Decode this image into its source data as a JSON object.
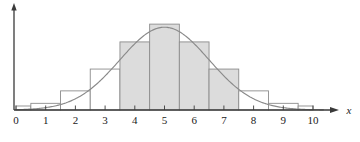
{
  "chart_data": {
    "type": "bar",
    "title": "",
    "subtitle": "",
    "xlabel": "x",
    "ylabel": "",
    "grid": false,
    "legend": null,
    "xlim": [
      0,
      10.6
    ],
    "ylim": [
      0,
      1.0
    ],
    "xticks": [
      "0",
      "1",
      "2",
      "3",
      "4",
      "5",
      "6",
      "7",
      "8",
      "9",
      "10"
    ],
    "xtick_values": [
      0,
      1,
      2,
      3,
      4,
      5,
      6,
      7,
      8,
      9,
      10
    ],
    "yticks": [],
    "bar_width": 1,
    "categories": [
      0.5,
      1,
      2,
      3,
      4,
      5,
      6,
      7,
      8,
      9,
      9.5
    ],
    "values": [
      0.045,
      0.075,
      0.215,
      0.46,
      0.765,
      0.965,
      0.765,
      0.46,
      0.215,
      0.075,
      0.045
    ],
    "bars": [
      {
        "center": 0.5,
        "left": 0.0,
        "right": 0.5,
        "height": 0.045,
        "shaded": false
      },
      {
        "center": 1.0,
        "left": 0.5,
        "right": 1.5,
        "height": 0.075,
        "shaded": false
      },
      {
        "center": 2.0,
        "left": 1.5,
        "right": 2.5,
        "height": 0.215,
        "shaded": false
      },
      {
        "center": 3.0,
        "left": 2.5,
        "right": 3.5,
        "height": 0.46,
        "shaded": false
      },
      {
        "center": 4.0,
        "left": 3.5,
        "right": 4.5,
        "height": 0.765,
        "shaded": true
      },
      {
        "center": 5.0,
        "left": 4.5,
        "right": 5.5,
        "height": 0.965,
        "shaded": true
      },
      {
        "center": 6.0,
        "left": 5.5,
        "right": 6.5,
        "height": 0.765,
        "shaded": true
      },
      {
        "center": 7.0,
        "left": 6.5,
        "right": 7.5,
        "height": 0.46,
        "shaded": true
      },
      {
        "center": 8.0,
        "left": 7.5,
        "right": 8.5,
        "height": 0.215,
        "shaded": false
      },
      {
        "center": 9.0,
        "left": 8.5,
        "right": 9.5,
        "height": 0.075,
        "shaded": false
      },
      {
        "center": 9.5,
        "left": 9.5,
        "right": 10.0,
        "height": 0.045,
        "shaded": false
      }
    ],
    "shaded_region": {
      "from": 3.5,
      "to": 7.5
    },
    "overlay_curve": {
      "type": "line",
      "name": "normal-density",
      "mean": 5.0,
      "sigma": 1.5,
      "peak": 0.93,
      "x": [
        0.0,
        0.5,
        1.0,
        1.5,
        2.0,
        2.5,
        3.0,
        3.5,
        4.0,
        4.5,
        5.0,
        5.5,
        6.0,
        6.5,
        7.0,
        7.5,
        8.0,
        8.5,
        9.0,
        9.5,
        10.0
      ],
      "y": [
        0.009,
        0.023,
        0.053,
        0.105,
        0.186,
        0.292,
        0.411,
        0.541,
        0.68,
        0.81,
        0.93,
        0.81,
        0.68,
        0.541,
        0.411,
        0.292,
        0.186,
        0.105,
        0.053,
        0.023,
        0.009
      ]
    },
    "colors": {
      "bar_fill_shaded": "#dcdcdc",
      "bar_fill_plain": "#ffffff",
      "bar_stroke": "#8c8c8c",
      "curve": "#8a8a8a",
      "axis": "#3a3a3a",
      "text": "#1a1a1a"
    }
  }
}
